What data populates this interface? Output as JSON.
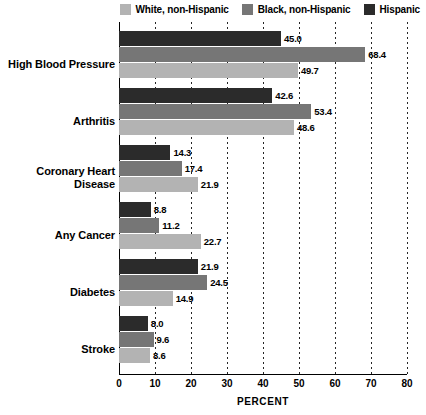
{
  "chart_data": {
    "type": "bar",
    "orientation": "horizontal",
    "title": "",
    "xlabel": "PERCENT",
    "ylabel": "",
    "xlim": [
      0,
      80
    ],
    "xticks": [
      0,
      10,
      20,
      30,
      40,
      50,
      60,
      70,
      80
    ],
    "grid": true,
    "legend_position": "top-right",
    "categories": [
      "High Blood Pressure",
      "Arthritis",
      "Coronary Heart Disease",
      "Any Cancer",
      "Diabetes",
      "Stroke"
    ],
    "series": [
      {
        "name": "Hispanic",
        "color": "#2b2b2b",
        "values": [
          45.0,
          42.6,
          14.3,
          8.8,
          21.9,
          8.0
        ]
      },
      {
        "name": "Black, non-Hispanic",
        "color": "#767676",
        "values": [
          68.4,
          53.4,
          17.4,
          11.2,
          24.5,
          9.6
        ]
      },
      {
        "name": "White, non-Hispanic",
        "color": "#b3b3b3",
        "values": [
          49.7,
          48.6,
          21.9,
          22.7,
          14.9,
          8.6
        ]
      }
    ],
    "value_labels": {
      "High Blood Pressure": [
        "45.0",
        "68.4",
        "49.7"
      ],
      "Arthritis": [
        "42.6",
        "53.4",
        "48.6"
      ],
      "Coronary Heart Disease": [
        "14.3",
        "17.4",
        "21.9"
      ],
      "Any Cancer": [
        "8.8",
        "11.2",
        "22.7"
      ],
      "Diabetes": [
        "21.9",
        "24.5",
        "14.9"
      ],
      "Stroke": [
        "8.0",
        "9.6",
        "8.6"
      ]
    }
  },
  "legend": {
    "items": [
      {
        "label": "White, non-Hispanic",
        "color": "#b3b3b3"
      },
      {
        "label": "Black, non-Hispanic",
        "color": "#767676"
      },
      {
        "label": "Hispanic",
        "color": "#2b2b2b"
      }
    ]
  },
  "axis": {
    "x_title": "PERCENT",
    "x_tick_labels": [
      "0",
      "10",
      "20",
      "30",
      "40",
      "50",
      "60",
      "70",
      "80"
    ]
  },
  "categories": [
    {
      "lines": [
        "High Blood Pressure"
      ]
    },
    {
      "lines": [
        "Arthritis"
      ]
    },
    {
      "lines": [
        "Coronary Heart",
        "Disease"
      ]
    },
    {
      "lines": [
        "Any Cancer"
      ]
    },
    {
      "lines": [
        "Diabetes"
      ]
    },
    {
      "lines": [
        "Stroke"
      ]
    }
  ]
}
